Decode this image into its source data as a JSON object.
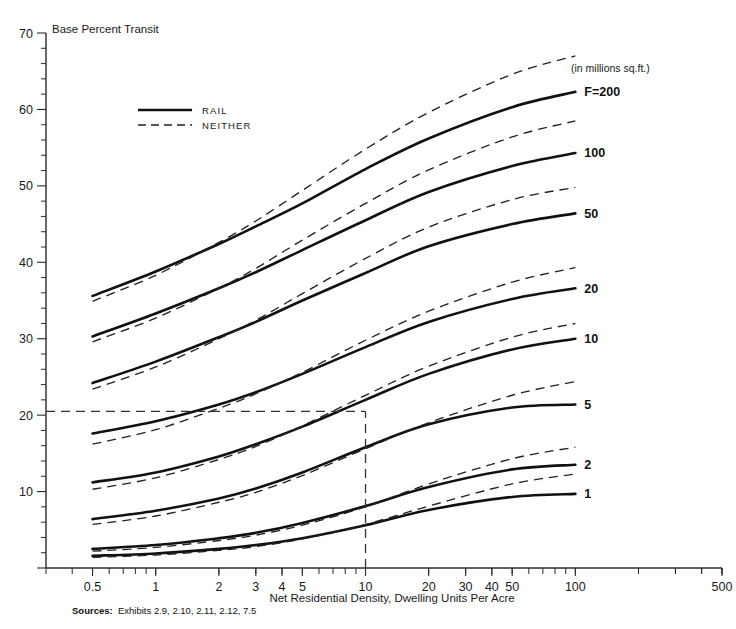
{
  "chart_data": {
    "type": "line",
    "title": "",
    "xlabel": "Net Residential Density, Dwelling Units Per Acre",
    "ylabel": "Base Percent Transit",
    "x_scale": "log",
    "xlim": [
      0.3,
      500
    ],
    "ylim": [
      0,
      70
    ],
    "grid": false,
    "y_ticks": [
      0,
      10,
      20,
      30,
      40,
      50,
      60,
      70
    ],
    "y_tick_labels": [
      "",
      "10",
      "20",
      "30",
      "40",
      "50",
      "60",
      "70"
    ],
    "y_minor_step": 2,
    "x_ticks": [
      0.5,
      1,
      2,
      3,
      4,
      5,
      10,
      20,
      30,
      40,
      50,
      100,
      500
    ],
    "x_tick_labels": [
      "0.5",
      "1",
      "2",
      "3",
      "4",
      "5",
      "10",
      "20",
      "30",
      "40",
      "50",
      "100",
      "500"
    ],
    "legend_position": "upper-left-inside",
    "legend": [
      {
        "name": "RAIL",
        "style": "solid"
      },
      {
        "name": "NEITHER",
        "style": "dashed"
      }
    ],
    "units_note": "(in millions sq.ft.)",
    "series_label_prefix": "F=",
    "annotations": [
      {
        "name": "reference-horizontal",
        "y": 20.5,
        "style": "dashed",
        "from_x": 0.3,
        "to_x": 10
      },
      {
        "name": "reference-vertical",
        "x": 10,
        "style": "dashed",
        "from_y": 0,
        "to_y": 20.5
      }
    ],
    "series": [
      {
        "name": "F=200",
        "label": "F=200",
        "style": "solid",
        "x": [
          0.5,
          1,
          2,
          3,
          5,
          10,
          20,
          50,
          100
        ],
        "values": [
          35.6,
          38.8,
          42.4,
          44.7,
          47.7,
          52.2,
          56.2,
          60.3,
          62.3
        ]
      },
      {
        "name": "F=200-neither",
        "label": "",
        "style": "dashed",
        "x": [
          0.5,
          1,
          2,
          3,
          5,
          10,
          20,
          50,
          100
        ],
        "values": [
          34.9,
          38.3,
          42.6,
          45.4,
          49.4,
          54.8,
          59.6,
          64.6,
          67.0
        ]
      },
      {
        "name": "F=100",
        "label": "100",
        "style": "solid",
        "x": [
          0.5,
          1,
          2,
          3,
          5,
          10,
          20,
          50,
          100
        ],
        "values": [
          30.3,
          33.3,
          36.6,
          38.7,
          41.6,
          45.5,
          49.2,
          52.6,
          54.3
        ]
      },
      {
        "name": "F=100-neither",
        "label": "",
        "style": "dashed",
        "x": [
          0.5,
          1,
          2,
          3,
          5,
          10,
          20,
          50,
          100
        ],
        "values": [
          29.6,
          32.7,
          36.6,
          39.2,
          42.9,
          47.7,
          52.1,
          56.4,
          58.5
        ]
      },
      {
        "name": "F=50",
        "label": "50",
        "style": "solid",
        "x": [
          0.5,
          1,
          2,
          3,
          5,
          10,
          20,
          50,
          100
        ],
        "values": [
          24.2,
          27.0,
          30.2,
          32.2,
          35.0,
          38.6,
          42.1,
          45.0,
          46.4
        ]
      },
      {
        "name": "F=50-neither",
        "label": "",
        "style": "dashed",
        "x": [
          0.5,
          1,
          2,
          3,
          5,
          10,
          20,
          50,
          100
        ],
        "values": [
          23.4,
          26.3,
          30.0,
          32.4,
          35.9,
          40.5,
          44.6,
          48.2,
          49.8
        ]
      },
      {
        "name": "F=20",
        "label": "20",
        "style": "solid",
        "x": [
          0.5,
          1,
          2,
          3,
          5,
          10,
          20,
          50,
          100
        ],
        "values": [
          17.6,
          19.2,
          21.4,
          23.0,
          25.4,
          28.9,
          32.2,
          35.2,
          36.6
        ]
      },
      {
        "name": "F=20-neither",
        "label": "",
        "style": "dashed",
        "x": [
          0.5,
          1,
          2,
          3,
          5,
          10,
          20,
          50,
          100
        ],
        "values": [
          16.2,
          18.1,
          20.9,
          22.8,
          25.6,
          29.8,
          33.6,
          37.4,
          39.3
        ]
      },
      {
        "name": "F=10",
        "label": "10",
        "style": "solid",
        "x": [
          0.5,
          1,
          2,
          3,
          5,
          10,
          20,
          50,
          100
        ],
        "values": [
          11.2,
          12.5,
          14.6,
          16.2,
          18.5,
          22.0,
          25.4,
          28.6,
          30.0
        ]
      },
      {
        "name": "F=10-neither",
        "label": "",
        "style": "dashed",
        "x": [
          0.5,
          1,
          2,
          3,
          5,
          10,
          20,
          50,
          100
        ],
        "values": [
          10.3,
          11.8,
          14.2,
          15.9,
          18.6,
          22.6,
          26.4,
          30.2,
          32.0
        ]
      },
      {
        "name": "F=5",
        "label": "5",
        "style": "solid",
        "x": [
          0.5,
          1,
          2,
          3,
          5,
          10,
          20,
          50,
          100
        ],
        "values": [
          6.4,
          7.5,
          9.1,
          10.4,
          12.5,
          15.8,
          18.8,
          21.0,
          21.4
        ]
      },
      {
        "name": "F=5-neither",
        "label": "",
        "style": "dashed",
        "x": [
          0.5,
          1,
          2,
          3,
          5,
          10,
          20,
          50,
          100
        ],
        "values": [
          5.7,
          6.8,
          8.6,
          9.9,
          12.1,
          15.6,
          19.0,
          22.6,
          24.4
        ]
      },
      {
        "name": "F=2",
        "label": "2",
        "style": "solid",
        "x": [
          0.5,
          1,
          2,
          3,
          5,
          10,
          20,
          50,
          100
        ],
        "values": [
          2.5,
          3.0,
          3.9,
          4.6,
          5.9,
          8.1,
          10.6,
          12.9,
          13.5
        ]
      },
      {
        "name": "F=2-neither",
        "label": "",
        "style": "dashed",
        "x": [
          0.5,
          1,
          2,
          3,
          5,
          10,
          20,
          50,
          100
        ],
        "values": [
          2.2,
          2.7,
          3.6,
          4.3,
          5.6,
          8.0,
          11.0,
          14.3,
          15.8
        ]
      },
      {
        "name": "F=1",
        "label": "1",
        "style": "solid",
        "x": [
          0.5,
          1,
          2,
          3,
          5,
          10,
          20,
          50,
          100
        ],
        "values": [
          1.6,
          1.9,
          2.5,
          3.0,
          3.9,
          5.6,
          7.6,
          9.3,
          9.7
        ]
      },
      {
        "name": "F=1-neither",
        "label": "",
        "style": "dashed",
        "x": [
          0.5,
          1,
          2,
          3,
          5,
          10,
          20,
          50,
          100
        ],
        "values": [
          1.4,
          1.7,
          2.3,
          2.8,
          3.8,
          5.7,
          8.1,
          11.0,
          12.3
        ]
      }
    ]
  },
  "footer": {
    "sources_label": "Sources:",
    "sources_text": "Exhibits 2.9, 2.10, 2.11, 2.12, 7.5"
  },
  "colors": {
    "ink": "#111111",
    "axis": "#2a2a2a",
    "background": "#ffffff"
  }
}
